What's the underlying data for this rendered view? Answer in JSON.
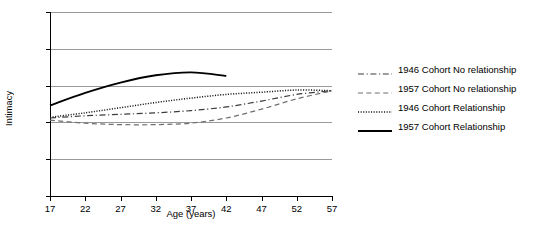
{
  "chart_data": {
    "type": "line",
    "title": "",
    "xlabel": "Age (years)",
    "ylabel": "Intimacy",
    "xlim": [
      17,
      57
    ],
    "ylim": [
      0,
      25
    ],
    "xticks": [
      17,
      22,
      27,
      32,
      37,
      42,
      47,
      52,
      57
    ],
    "yticks": [
      0,
      5,
      10,
      15,
      20,
      25
    ],
    "grid": "horizontal",
    "legend_position": "right",
    "series": [
      {
        "name": "1946 Cohort No relationship",
        "style": "dash-dot",
        "color": "#3c3c3c",
        "x": [
          17,
          22,
          27,
          32,
          37,
          42,
          47,
          52,
          57
        ],
        "values": [
          10.6,
          10.9,
          11.1,
          11.3,
          11.6,
          12.1,
          12.9,
          13.8,
          14.3
        ]
      },
      {
        "name": "1957 Cohort No relationship",
        "style": "dashed",
        "color": "#6e6e6e",
        "x": [
          17,
          22,
          27,
          32,
          37,
          42,
          47,
          52,
          57
        ],
        "values": [
          10.3,
          9.9,
          9.7,
          9.7,
          9.9,
          10.6,
          11.8,
          13.2,
          14.3
        ]
      },
      {
        "name": "1946 Cohort Relationship",
        "style": "dotted",
        "color": "#1a1a1a",
        "x": [
          17,
          22,
          27,
          32,
          37,
          42,
          47,
          52,
          57
        ],
        "values": [
          10.7,
          11.3,
          12.0,
          12.7,
          13.3,
          13.8,
          14.1,
          14.4,
          14.3
        ]
      },
      {
        "name": "1957 Cohort Relationship",
        "style": "solid",
        "color": "#000000",
        "x": [
          17,
          22,
          27,
          32,
          37,
          42
        ],
        "values": [
          12.3,
          14.0,
          15.4,
          16.4,
          16.8,
          16.3
        ]
      }
    ]
  },
  "legend": {
    "items": [
      {
        "label": "1946 Cohort No relationship",
        "swatch": "dash-dot-line-icon"
      },
      {
        "label": "1957 Cohort No relationship",
        "swatch": "dashed-line-icon"
      },
      {
        "label": "1946 Cohort Relationship",
        "swatch": "dotted-line-icon"
      },
      {
        "label": "1957 Cohort Relationship",
        "swatch": "solid-line-icon"
      }
    ]
  }
}
